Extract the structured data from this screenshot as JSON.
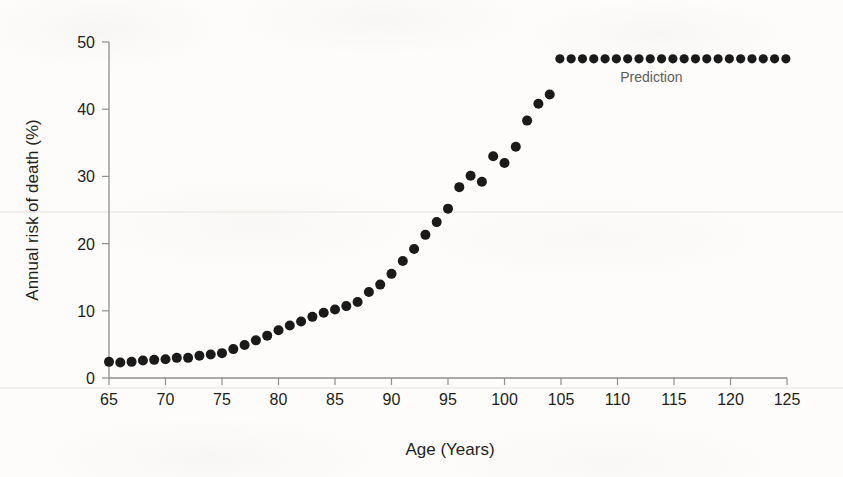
{
  "chart_data": {
    "type": "scatter",
    "title": "",
    "xlabel": "Age (Years)",
    "ylabel": "Annual risk of death (%)",
    "xlim": [
      65,
      125
    ],
    "ylim": [
      0,
      50
    ],
    "xticks": [
      65,
      70,
      75,
      80,
      85,
      90,
      95,
      100,
      105,
      110,
      115,
      120,
      125
    ],
    "yticks": [
      0,
      10,
      20,
      30,
      40,
      50
    ],
    "grid": false,
    "legend_position": "none",
    "marker": "filled-circle",
    "marker_color": "#1a1a1a",
    "x": [
      65,
      66,
      67,
      68,
      69,
      70,
      71,
      72,
      73,
      74,
      75,
      76,
      77,
      78,
      79,
      80,
      81,
      82,
      83,
      84,
      85,
      86,
      87,
      88,
      89,
      90,
      91,
      92,
      93,
      94,
      95,
      96,
      97,
      98,
      99,
      100,
      101,
      102,
      103,
      104
    ],
    "values": [
      2.4,
      2.3,
      2.4,
      2.6,
      2.7,
      2.8,
      3.0,
      3.0,
      3.3,
      3.5,
      3.7,
      4.3,
      4.9,
      5.6,
      6.3,
      7.1,
      7.8,
      8.4,
      9.1,
      9.7,
      10.2,
      10.7,
      11.3,
      12.8,
      13.9,
      15.5,
      17.4,
      19.2,
      21.3,
      23.2,
      25.2,
      28.4,
      30.1,
      29.2,
      33.0,
      32.0,
      34.4,
      38.3,
      40.8,
      42.2
    ],
    "series": [
      {
        "name": "Observed annual risk of death",
        "x": [
          65,
          66,
          67,
          68,
          69,
          70,
          71,
          72,
          73,
          74,
          75,
          76,
          77,
          78,
          79,
          80,
          81,
          82,
          83,
          84,
          85,
          86,
          87,
          88,
          89,
          90,
          91,
          92,
          93,
          94,
          95,
          96,
          97,
          98,
          99,
          100,
          101,
          102,
          103,
          104
        ],
        "values": [
          2.4,
          2.3,
          2.4,
          2.6,
          2.7,
          2.8,
          3.0,
          3.0,
          3.3,
          3.5,
          3.7,
          4.3,
          4.9,
          5.6,
          6.3,
          7.1,
          7.8,
          8.4,
          9.1,
          9.7,
          10.2,
          10.7,
          11.3,
          12.8,
          13.9,
          15.5,
          17.4,
          19.2,
          21.3,
          23.2,
          25.2,
          28.4,
          30.1,
          29.2,
          33.0,
          32.0,
          34.4,
          38.3,
          40.8,
          42.2
        ]
      },
      {
        "name": "Prediction",
        "x": [
          104.9,
          105.9,
          106.9,
          107.9,
          108.9,
          109.9,
          110.9,
          111.9,
          112.9,
          113.9,
          114.9,
          115.9,
          116.9,
          117.9,
          118.9,
          119.9,
          120.9,
          121.9,
          122.9,
          123.9,
          124.9
        ],
        "values": [
          47.5,
          47.5,
          47.5,
          47.5,
          47.5,
          47.5,
          47.5,
          47.5,
          47.5,
          47.5,
          47.5,
          47.5,
          47.5,
          47.5,
          47.5,
          47.5,
          47.5,
          47.5,
          47.5,
          47.5,
          47.5
        ]
      }
    ],
    "annotations": [
      {
        "text": "Prediction",
        "x": 113,
        "y": 44.0
      }
    ]
  },
  "axes": {
    "x_title": "Age (Years)",
    "y_title": "Annual risk of death (%)",
    "x_tick_labels": [
      "65",
      "70",
      "75",
      "80",
      "85",
      "90",
      "95",
      "100",
      "105",
      "110",
      "115",
      "120",
      "125"
    ],
    "y_tick_labels": [
      "0",
      "10",
      "20",
      "30",
      "40",
      "50"
    ]
  },
  "colors": {
    "marker": "#1a1a1a",
    "axis": "#8e8e8e",
    "text": "#231f20",
    "annotation": "#5d5d5d",
    "background": "#fdfcfa"
  }
}
